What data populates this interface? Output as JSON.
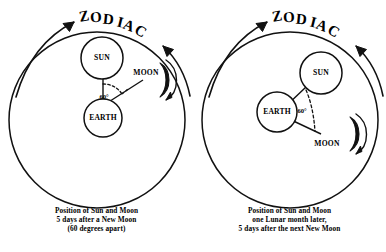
{
  "diagram": {
    "type": "astronomy-diagram",
    "panels": [
      {
        "id": "left",
        "title": "ZODIAC",
        "bodies": {
          "sun": "SUN",
          "earth": "EARTH",
          "moon": "MOON"
        },
        "angle_label": "60°",
        "caption_lines": [
          "Position of Sun and Moon",
          "5 days after a New Moon",
          "(60 degrees apart)"
        ]
      },
      {
        "id": "right",
        "title": "ZODIAC",
        "bodies": {
          "sun": "SUN",
          "earth": "EARTH",
          "moon": "MOON"
        },
        "angle_label": "60°",
        "caption_lines": [
          "Position of Sun and Moon",
          "one Lunar month later,",
          "5 days after the next New Moon"
        ]
      }
    ],
    "colors": {
      "ink": "#111111",
      "background": "#ffffff"
    }
  }
}
